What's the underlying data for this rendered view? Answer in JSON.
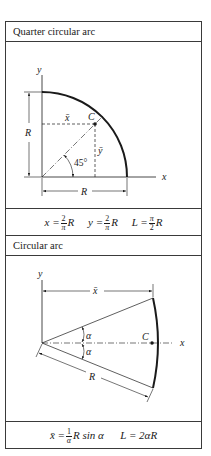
{
  "sections": [
    {
      "title": "Quarter circular arc",
      "diagram": {
        "axis_x_label": "x",
        "axis_y_label": "y",
        "radius_label_vertical": "R",
        "radius_label_horizontal": "R",
        "centroid_label": "C",
        "xbar_label": "x̄",
        "ybar_label": "ȳ",
        "angle_label": "45°"
      },
      "formula": {
        "x_lhs": "x =",
        "x_num": "2",
        "x_den": "π",
        "x_tail": "R",
        "y_lhs": "y =",
        "y_num": "2",
        "y_den": "π",
        "y_tail": "R",
        "L_lhs": "L =",
        "L_num": "π",
        "L_den": "2",
        "L_tail": "R"
      }
    },
    {
      "title": "Circular arc",
      "diagram": {
        "axis_x_label": "x",
        "axis_y_label": "y",
        "xbar_label": "x̄",
        "centroid_label": "C",
        "alpha_upper_label": "α",
        "alpha_lower_label": "α",
        "radius_label": "R"
      },
      "formula": {
        "x_lhs": "x̄ =",
        "x_num": "1",
        "x_den": "α",
        "x_tail": "R sin α",
        "L_expr": "L = 2αR"
      }
    }
  ],
  "colors": {
    "line": "#1a1a1a",
    "border": "#3a3a3a",
    "background": "#ffffff"
  }
}
